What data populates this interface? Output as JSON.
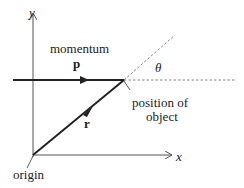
{
  "diagram": {
    "axes": {
      "x_label": "x",
      "y_label": "y"
    },
    "labels": {
      "momentum": "momentum",
      "momentum_symbol": "p",
      "position_symbol": "r",
      "angle_symbol": "θ",
      "position_of_object_line1": "position of",
      "position_of_object_line2": "object",
      "origin": "origin"
    },
    "colors": {
      "line": "#222222",
      "axis": "#555555",
      "dashed": "#666666",
      "background": "#ffffff"
    }
  }
}
